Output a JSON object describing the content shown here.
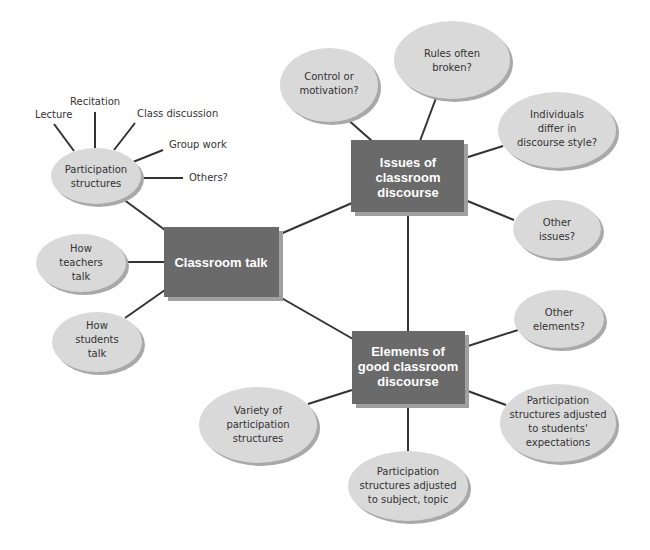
{
  "colors": {
    "box_fill": "#6a6a6a",
    "box_shadow": "#a0a0a0",
    "oval_fill": "#d9d9d9",
    "oval_shadow": "#a9a9a9",
    "line": "#333333",
    "box_text": "#ffffff",
    "oval_text": "#333333"
  },
  "central": {
    "label": "Classroom talk"
  },
  "issues": {
    "line1": "Issues of",
    "line2": "classroom",
    "line3": "discourse"
  },
  "elements": {
    "line1": "Elements of",
    "line2": "good classroom",
    "line3": "discourse"
  },
  "participation": {
    "line1": "Participation",
    "line2": "structures",
    "leaves": [
      "Lecture",
      "Recitation",
      "Class discussion",
      "Group work",
      "Others?"
    ]
  },
  "talk_nodes": [
    {
      "lines": [
        "How",
        "teachers",
        "talk"
      ]
    },
    {
      "lines": [
        "How",
        "students",
        "talk"
      ]
    }
  ],
  "issue_nodes": [
    {
      "lines": [
        "Control or",
        "motivation?"
      ]
    },
    {
      "lines": [
        "Rules often",
        "broken?"
      ]
    },
    {
      "lines": [
        "Individuals",
        "differ in",
        "discourse style?"
      ]
    },
    {
      "lines": [
        "Other",
        "issues?"
      ]
    }
  ],
  "element_nodes": [
    {
      "lines": [
        "Other",
        "elements?"
      ]
    },
    {
      "lines": [
        "Participation",
        "structures adjusted",
        "to students'",
        "expectations"
      ]
    },
    {
      "lines": [
        "Participation",
        "structures adjusted",
        "to subject, topic"
      ]
    },
    {
      "lines": [
        "Variety of",
        "participation",
        "structures"
      ]
    }
  ]
}
